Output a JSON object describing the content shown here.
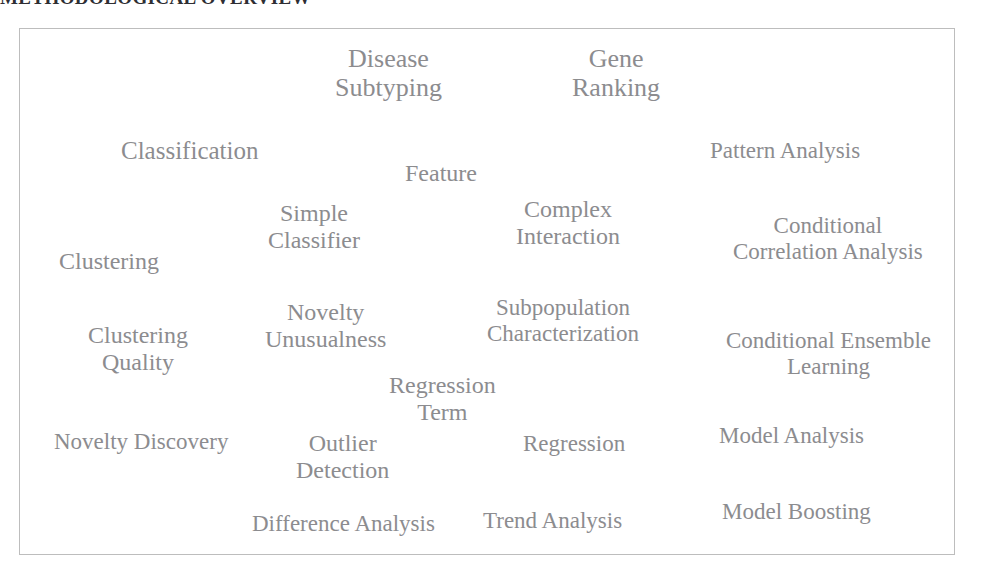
{
  "heading": {
    "text": "METHODOLOGICAL OVERVIEW"
  },
  "panel": {
    "name": "term-cloud-panel",
    "border_color": "#bdbdbd",
    "background_color": "#ffffff",
    "text_color": "#8c8c8f"
  },
  "chart_data": {
    "type": "table",
    "title": "METHODOLOGICAL OVERVIEW",
    "xlabel": "",
    "ylabel": "",
    "legend": [],
    "terms": [
      {
        "id": "disease-subtyping",
        "lines": [
          "Disease",
          "Subtyping"
        ],
        "x": 387,
        "y": 72,
        "size": 26
      },
      {
        "id": "gene-ranking",
        "lines": [
          "Gene",
          "Ranking"
        ],
        "x": 615,
        "y": 72,
        "size": 26
      },
      {
        "id": "classification",
        "lines": [
          "Classification"
        ],
        "x": 188,
        "y": 150,
        "size": 25
      },
      {
        "id": "pattern-analysis",
        "lines": [
          "Pattern Analysis"
        ],
        "x": 784,
        "y": 150,
        "size": 23
      },
      {
        "id": "feature",
        "lines": [
          "Feature"
        ],
        "x": 440,
        "y": 172,
        "size": 24
      },
      {
        "id": "simple-classifier",
        "lines": [
          "Simple",
          "Classifier"
        ],
        "x": 313,
        "y": 226,
        "size": 24
      },
      {
        "id": "complex-interaction",
        "lines": [
          "Complex",
          "Interaction"
        ],
        "x": 567,
        "y": 222,
        "size": 24
      },
      {
        "id": "conditional-correlation-analysis",
        "lines": [
          "Conditional",
          "Correlation Analysis"
        ],
        "x": 827,
        "y": 238,
        "size": 23
      },
      {
        "id": "clustering",
        "lines": [
          "Clustering"
        ],
        "x": 108,
        "y": 260,
        "size": 24
      },
      {
        "id": "novelty-unusualness",
        "lines": [
          "Novelty",
          "Unusualness"
        ],
        "x": 324,
        "y": 325,
        "size": 24
      },
      {
        "id": "subpopulation-characterization",
        "lines": [
          "Subpopulation",
          "Characterization"
        ],
        "x": 562,
        "y": 320,
        "size": 23
      },
      {
        "id": "clustering-quality",
        "lines": [
          "Clustering",
          "Quality"
        ],
        "x": 137,
        "y": 348,
        "size": 24
      },
      {
        "id": "conditional-ensemble-learning",
        "lines": [
          "Conditional Ensemble",
          "Learning"
        ],
        "x": 827,
        "y": 353,
        "size": 23
      },
      {
        "id": "regression-term",
        "lines": [
          "Regression",
          "Term"
        ],
        "x": 441,
        "y": 398,
        "size": 24
      },
      {
        "id": "novelty-discovery",
        "lines": [
          "Novelty Discovery"
        ],
        "x": 140,
        "y": 441,
        "size": 23
      },
      {
        "id": "outlier-detection",
        "lines": [
          "Outlier",
          "Detection"
        ],
        "x": 341,
        "y": 456,
        "size": 24
      },
      {
        "id": "regression",
        "lines": [
          "Regression"
        ],
        "x": 573,
        "y": 443,
        "size": 23
      },
      {
        "id": "model-analysis",
        "lines": [
          "Model Analysis"
        ],
        "x": 790,
        "y": 435,
        "size": 23
      },
      {
        "id": "difference-analysis",
        "lines": [
          "Difference Analysis"
        ],
        "x": 342,
        "y": 523,
        "size": 23
      },
      {
        "id": "trend-analysis",
        "lines": [
          "Trend Analysis"
        ],
        "x": 551,
        "y": 520,
        "size": 23
      },
      {
        "id": "model-boosting",
        "lines": [
          "Model Boosting"
        ],
        "x": 795,
        "y": 511,
        "size": 23
      }
    ]
  }
}
